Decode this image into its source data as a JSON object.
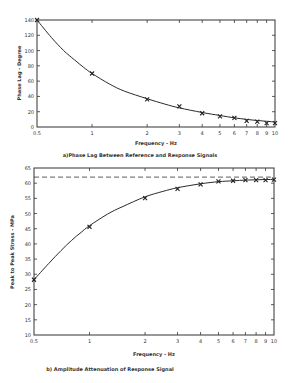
{
  "chart_data": [
    {
      "type": "line",
      "id": "phase",
      "title": "a)Phase Lag Between Reference and Response Signals",
      "xlabel": "Frequency - Hz",
      "ylabel": "Phase Lag - Degree",
      "xscale": "log",
      "xlim": [
        0.5,
        10
      ],
      "ylim": [
        0,
        140
      ],
      "xticks": [
        0.5,
        1,
        2,
        3,
        4,
        5,
        6,
        7,
        8,
        9,
        10
      ],
      "xtick_labels": [
        "0.5",
        "1",
        "2",
        "3",
        "4",
        "5",
        "6",
        "7",
        "8",
        "9",
        "10"
      ],
      "yticks": [
        0,
        20,
        40,
        60,
        80,
        100,
        120,
        140
      ],
      "ytick_labels": [
        "0",
        "20",
        "40",
        "60",
        "80",
        "100",
        "120",
        "140"
      ],
      "grid": false,
      "series": [
        {
          "name": "measured",
          "style": "markers-x",
          "x": [
            0.5,
            1,
            2,
            3,
            4,
            5,
            6,
            7,
            8,
            9,
            10
          ],
          "y": [
            140,
            70,
            36,
            27,
            18,
            14,
            12,
            8,
            7,
            5,
            5
          ]
        },
        {
          "name": "fitted curve",
          "style": "solid",
          "x": [
            0.5,
            0.6,
            0.7,
            0.8,
            0.9,
            1,
            1.25,
            1.5,
            2,
            2.5,
            3,
            4,
            5,
            6,
            7,
            8,
            9,
            10
          ],
          "y": [
            140,
            117,
            100,
            88,
            78,
            70,
            56,
            47,
            37,
            30,
            25,
            19,
            15,
            12,
            10,
            8.5,
            7.5,
            6.5
          ]
        }
      ]
    },
    {
      "type": "line",
      "id": "amplitude",
      "title": "b) Amplitude Attenuation of Response Signal",
      "xlabel": "Frequency - Hz",
      "ylabel": "Peak to Peak Stress - MPa",
      "xscale": "log",
      "xlim": [
        0.5,
        10
      ],
      "ylim": [
        10,
        65
      ],
      "xticks": [
        0.5,
        1,
        2,
        3,
        4,
        5,
        6,
        7,
        8,
        9,
        10
      ],
      "xtick_labels": [
        "0.5",
        "1",
        "2",
        "3",
        "4",
        "5",
        "6",
        "7",
        "8",
        "9",
        "10"
      ],
      "yticks": [
        10,
        15,
        20,
        25,
        30,
        35,
        40,
        45,
        50,
        55,
        60,
        65
      ],
      "ytick_labels": [
        "10",
        "15",
        "20",
        "25",
        "30",
        "35",
        "40",
        "45",
        "50",
        "55",
        "60",
        "65"
      ],
      "grid": false,
      "reference_line": {
        "y": 62,
        "style": "dashed"
      },
      "series": [
        {
          "name": "measured",
          "style": "markers-x",
          "x": [
            0.5,
            1,
            2,
            3,
            4,
            5,
            6,
            7,
            8,
            9,
            10
          ],
          "y": [
            28.2,
            45.6,
            55.1,
            58.1,
            59.6,
            60.6,
            60.8,
            61,
            61,
            61,
            61.2
          ]
        },
        {
          "name": "fitted curve",
          "style": "solid",
          "x": [
            0.5,
            0.6,
            0.7,
            0.8,
            0.9,
            1,
            1.25,
            1.5,
            2,
            2.5,
            3,
            4,
            5,
            6,
            7,
            8,
            9,
            10
          ],
          "y": [
            28.2,
            33.5,
            37.8,
            41.2,
            43.8,
            46,
            49.8,
            52.2,
            55.5,
            57.3,
            58.5,
            59.8,
            60.5,
            60.8,
            61,
            61.1,
            61.2,
            61.2
          ]
        }
      ]
    }
  ]
}
